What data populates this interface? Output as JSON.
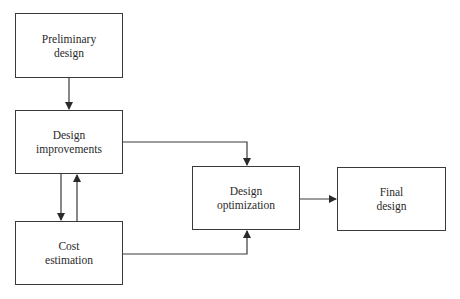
{
  "diagram": {
    "nodes": [
      {
        "id": "preliminary",
        "lines": [
          "Preliminary",
          "design"
        ]
      },
      {
        "id": "improvements",
        "lines": [
          "Design",
          "improvements"
        ]
      },
      {
        "id": "cost",
        "lines": [
          "Cost",
          "estimation"
        ]
      },
      {
        "id": "optimization",
        "lines": [
          "Design",
          "optimization"
        ]
      },
      {
        "id": "final",
        "lines": [
          "Final",
          "design"
        ]
      }
    ],
    "edges": [
      {
        "from": "preliminary",
        "to": "improvements"
      },
      {
        "from": "improvements",
        "to": "cost"
      },
      {
        "from": "cost",
        "to": "improvements"
      },
      {
        "from": "improvements",
        "to": "optimization"
      },
      {
        "from": "cost",
        "to": "optimization"
      },
      {
        "from": "optimization",
        "to": "final"
      }
    ],
    "colors": {
      "stroke": "#3a3a3a",
      "background": "#ffffff"
    }
  }
}
